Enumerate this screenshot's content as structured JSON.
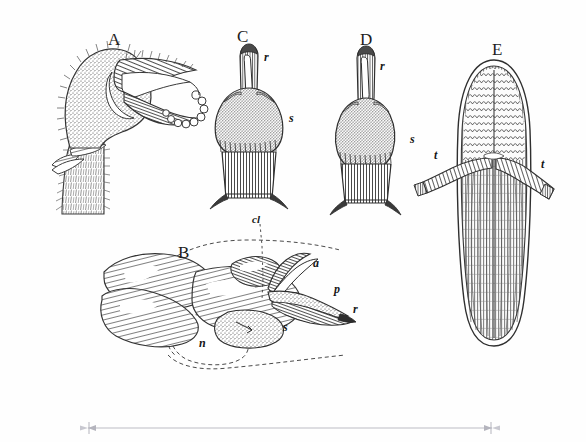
{
  "plate": {
    "title": "Botanical engraving plate",
    "background_color": "#fefefe",
    "ink_color": "#2b2b2b",
    "width": 586,
    "height": 442
  },
  "figures": [
    {
      "id": "A",
      "letter": "A",
      "caption": "A",
      "description": "hairy curved flower bud on stem with recurved hood",
      "x": 108,
      "y": 31
    },
    {
      "id": "B",
      "letter": "B",
      "caption": "B",
      "description": "longitudinal section of flower showing interior parts",
      "x": 178,
      "y": 244
    },
    {
      "id": "C",
      "letter": "C",
      "caption": "C",
      "description": "anther front view with beak",
      "x": 237,
      "y": 28
    },
    {
      "id": "D",
      "letter": "D",
      "caption": "D",
      "description": "anther side view with beak",
      "x": 360,
      "y": 31
    },
    {
      "id": "E",
      "letter": "E",
      "caption": "E",
      "description": "pollinium / elongate organ with two tails",
      "x": 492,
      "y": 41
    }
  ],
  "part_labels": [
    {
      "id": "r-c",
      "text": "r",
      "figure": "C",
      "x": 264,
      "y": 51,
      "italic": true
    },
    {
      "id": "s-c",
      "text": "s",
      "figure": "C",
      "x": 289,
      "y": 112,
      "italic": true
    },
    {
      "id": "r-d",
      "text": "r",
      "figure": "D",
      "x": 380,
      "y": 60,
      "italic": true
    },
    {
      "id": "s-d",
      "text": "s",
      "figure": "D",
      "x": 410,
      "y": 133,
      "italic": true
    },
    {
      "id": "t-left",
      "text": "t",
      "figure": "E",
      "x": 434,
      "y": 149,
      "italic": true
    },
    {
      "id": "t-right",
      "text": "t",
      "figure": "E",
      "x": 541,
      "y": 158,
      "italic": true
    },
    {
      "id": "cl",
      "text": "cl",
      "figure": "B",
      "x": 254,
      "y": 216,
      "italic": true
    },
    {
      "id": "a",
      "text": "a",
      "figure": "B",
      "x": 313,
      "y": 257,
      "italic": true
    },
    {
      "id": "p",
      "text": "p",
      "figure": "B",
      "x": 334,
      "y": 283,
      "italic": true
    },
    {
      "id": "r-b",
      "text": "r",
      "figure": "B",
      "x": 353,
      "y": 303,
      "italic": true
    },
    {
      "id": "s-b",
      "text": "s",
      "figure": "B",
      "x": 283,
      "y": 321,
      "italic": true
    },
    {
      "id": "n",
      "text": "n",
      "figure": "B",
      "x": 199,
      "y": 337,
      "italic": true
    }
  ],
  "scale_bar": {
    "name": "scale-measure-line",
    "x_start": 85,
    "x_end": 495,
    "y": 428,
    "color": "#b9b9c0",
    "label": ""
  }
}
